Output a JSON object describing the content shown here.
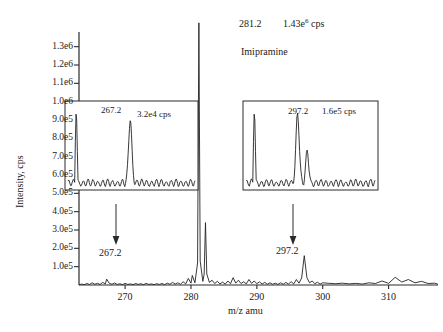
{
  "chart_data": {
    "type": "line",
    "title": "",
    "xlabel": "m/z amu",
    "ylabel": "Intensity, cps",
    "xlim": [
      263.0,
      317.5
    ],
    "ylim": [
      0,
      1380000
    ],
    "grid": false,
    "legend": "none",
    "x_ticks": [
      270,
      280,
      290,
      300,
      310
    ],
    "x_tick_labels": [
      "270",
      "280",
      "290",
      "300",
      "310"
    ],
    "y_ticks": [
      100000,
      200000,
      300000,
      400000,
      500000,
      600000,
      700000,
      800000,
      900000,
      1000000,
      1100000,
      1200000,
      1300000
    ],
    "y_tick_labels": [
      "1.0e5",
      "2.0e5",
      "3.0e5",
      "4.0e5",
      "5.0e5",
      "6.0e5",
      "7.0e5",
      "8.0e5",
      "9.0e5",
      "1.0e6",
      "1.1e6",
      "1.2e6",
      "1.3e6"
    ],
    "peaks": [
      {
        "mz": 281.2,
        "intensity": 1430000,
        "label": "281.2",
        "value_label": "1.43e6 cps"
      },
      {
        "mz": 282.2,
        "intensity": 340000,
        "label": "282.2",
        "value_label": ""
      },
      {
        "mz": 267.2,
        "intensity": 32000,
        "label": "267.2",
        "value_label": "3.2e4 cps"
      },
      {
        "mz": 297.2,
        "intensity": 160000,
        "label": "297.2",
        "value_label": "1.6e5 cps"
      }
    ],
    "annotations": [
      {
        "name": "main-peak-mz",
        "text": "281.2"
      },
      {
        "name": "main-peak-intensity",
        "text": "1.43e",
        "sup": "6",
        "suffix": " cps"
      },
      {
        "name": "compound-name",
        "text": "Imipramine"
      },
      {
        "name": "left-arrow-label",
        "text": "267.2"
      },
      {
        "name": "right-arrow-label",
        "text": "297.2"
      }
    ],
    "insets": [
      {
        "name": "left-inset",
        "peak_label": "267.2",
        "value_label": "3.2e4 cps",
        "points_to_mz": 267.2,
        "description": "magnified view of 267.2 fragment region showing noise baseline with one dominant centered peak"
      },
      {
        "name": "right-inset",
        "peak_label": "297.2",
        "value_label": "1.6e5 cps",
        "points_to_mz": 297.2,
        "description": "magnified view of 297.2 fragment region showing noise baseline with one dominant peak and a smaller adjacent peak"
      }
    ],
    "series": [
      {
        "name": "mass spectrum",
        "color": "#1a1a1a",
        "x": [
          263.0,
          263.4,
          263.8,
          264.2,
          264.6,
          265.0,
          265.4,
          265.8,
          266.2,
          266.6,
          267.0,
          267.2,
          267.6,
          268.0,
          268.4,
          268.8,
          269.2,
          269.6,
          270.0,
          270.4,
          270.8,
          271.2,
          271.6,
          272.0,
          272.4,
          272.8,
          273.2,
          273.6,
          274.0,
          274.4,
          274.8,
          275.2,
          275.6,
          276.0,
          276.4,
          276.8,
          277.2,
          277.6,
          278.0,
          278.4,
          278.8,
          279.2,
          279.6,
          280.0,
          280.2,
          280.6,
          281.0,
          281.2,
          281.4,
          281.8,
          282.0,
          282.2,
          282.4,
          282.8,
          283.2,
          283.6,
          284.0,
          284.4,
          284.8,
          285.2,
          285.6,
          286.0,
          286.4,
          286.8,
          287.2,
          287.6,
          288.0,
          288.4,
          288.8,
          289.2,
          289.6,
          290.0,
          290.4,
          290.8,
          291.2,
          291.6,
          292.0,
          292.4,
          292.8,
          293.2,
          293.6,
          294.0,
          294.4,
          294.8,
          295.2,
          295.6,
          296.0,
          296.4,
          296.8,
          297.2,
          297.6,
          298.0,
          298.4,
          298.8,
          299.2,
          299.6,
          300.0,
          301.0,
          302.0,
          303.0,
          304.0,
          305.0,
          306.0,
          307.0,
          308.0,
          309.0,
          310.0,
          311.0,
          312.0,
          313.0,
          314.0,
          315.0,
          316.0,
          317.0,
          317.5
        ],
        "y": [
          1000,
          5000,
          2000,
          8000,
          3000,
          12000,
          4000,
          9000,
          3000,
          14000,
          6000,
          32000,
          9000,
          4000,
          11000,
          3000,
          7000,
          2000,
          9000,
          3000,
          6000,
          2000,
          8000,
          3000,
          7000,
          2000,
          9000,
          3000,
          6000,
          2000,
          7000,
          3000,
          8000,
          2000,
          10000,
          4000,
          14000,
          5000,
          12000,
          4000,
          18000,
          6000,
          36000,
          10000,
          52000,
          12000,
          120000,
          1430000,
          130000,
          20000,
          60000,
          340000,
          60000,
          14000,
          26000,
          8000,
          20000,
          6000,
          16000,
          5000,
          22000,
          7000,
          40000,
          10000,
          26000,
          8000,
          18000,
          6000,
          30000,
          9000,
          22000,
          7000,
          17000,
          5000,
          14000,
          4000,
          12000,
          4000,
          10000,
          3000,
          12000,
          4000,
          14000,
          5000,
          18000,
          6000,
          30000,
          10000,
          38000,
          160000,
          40000,
          12000,
          22000,
          7000,
          15000,
          5000,
          12000,
          9000,
          7000,
          10000,
          6000,
          9000,
          5000,
          12000,
          8000,
          22000,
          9000,
          42000,
          16000,
          30000,
          12000,
          20000,
          8000,
          10000,
          4000
        ]
      }
    ]
  },
  "axes": {
    "y_title": "Intensity, cps",
    "x_title": "m/z amu"
  }
}
